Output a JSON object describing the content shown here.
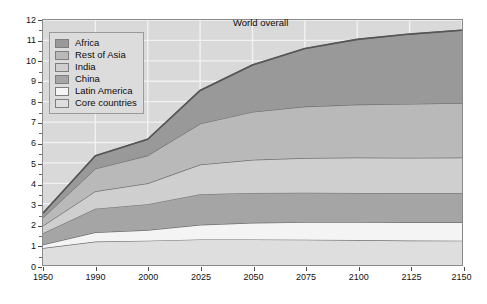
{
  "figure": {
    "background": "#ffffff",
    "plot_background": "#d9d9d9",
    "gridline_color": "#f2f2f2",
    "frame_color": "#8a8a8a"
  },
  "annotation": {
    "world_overall": "World overall"
  },
  "legend": {
    "position": "top-left",
    "entries": [
      {
        "label": "Africa",
        "color": "#999999"
      },
      {
        "label": "Rest of Asia",
        "color": "#b9b9b9"
      },
      {
        "label": "India",
        "color": "#cfcfcf"
      },
      {
        "label": "China",
        "color": "#a5a5a5"
      },
      {
        "label": "Latin America",
        "color": "#f4f4f4"
      },
      {
        "label": "Core countries",
        "color": "#dedede"
      }
    ]
  },
  "chart_data": {
    "type": "area",
    "stacked": true,
    "title": "",
    "subtitle": "",
    "xlabel": "",
    "ylabel": "",
    "ylim": [
      0,
      12
    ],
    "yticks": [
      0,
      1,
      2,
      3,
      4,
      5,
      6,
      7,
      8,
      9,
      10,
      11,
      12
    ],
    "ytick_labels": [
      "0",
      "1",
      "2",
      "3",
      "4",
      "5",
      "6",
      "7",
      "8",
      "9",
      "10",
      "11",
      "12"
    ],
    "grid": true,
    "x_axis_scale": "categorical-uneven-years",
    "x": [
      1950,
      1990,
      2000,
      2025,
      2050,
      2075,
      2100,
      2125,
      2150
    ],
    "xtick_labels": [
      "1950",
      "1990",
      "2000",
      "2025",
      "2050",
      "2075",
      "2100",
      "2125",
      "2150"
    ],
    "stack_order_bottom_to_top": [
      "Core countries",
      "Latin America",
      "China",
      "India",
      "Rest of Asia",
      "Africa"
    ],
    "series": [
      {
        "name": "Core countries",
        "color": "#dedede",
        "values": [
          0.83,
          1.15,
          1.19,
          1.25,
          1.25,
          1.24,
          1.22,
          1.2,
          1.19
        ]
      },
      {
        "name": "Latin America",
        "color": "#f4f4f4",
        "values": [
          0.17,
          0.45,
          0.52,
          0.72,
          0.82,
          0.86,
          0.88,
          0.89,
          0.9
        ]
      },
      {
        "name": "China",
        "color": "#a5a5a5",
        "values": [
          0.56,
          1.16,
          1.27,
          1.5,
          1.46,
          1.44,
          1.43,
          1.42,
          1.42
        ]
      },
      {
        "name": "India",
        "color": "#cfcfcf",
        "values": [
          0.36,
          0.85,
          1.02,
          1.45,
          1.62,
          1.7,
          1.73,
          1.74,
          1.75
        ]
      },
      {
        "name": "Rest of Asia",
        "color": "#b9b9b9",
        "values": [
          0.4,
          1.11,
          1.36,
          2.0,
          2.35,
          2.52,
          2.6,
          2.64,
          2.67
        ]
      },
      {
        "name": "Africa",
        "color": "#999999",
        "values": [
          0.22,
          0.63,
          0.8,
          1.63,
          2.3,
          2.84,
          3.19,
          3.42,
          3.57
        ]
      }
    ],
    "cumulative_top_of_each_band": {
      "Core countries": [
        0.83,
        1.15,
        1.19,
        1.25,
        1.25,
        1.24,
        1.22,
        1.2,
        1.19
      ],
      "Latin America": [
        1.0,
        1.6,
        1.71,
        1.97,
        2.07,
        2.1,
        2.1,
        2.09,
        2.09
      ],
      "China": [
        1.56,
        2.76,
        2.98,
        3.47,
        3.53,
        3.54,
        3.53,
        3.51,
        3.51
      ],
      "India": [
        1.92,
        3.61,
        4.0,
        4.92,
        5.15,
        5.24,
        5.26,
        5.25,
        5.26
      ],
      "Rest of Asia": [
        2.32,
        4.72,
        5.36,
        6.92,
        7.5,
        7.76,
        7.86,
        7.89,
        7.93
      ],
      "Africa": [
        2.54,
        5.35,
        6.16,
        8.55,
        9.8,
        10.6,
        11.05,
        11.31,
        11.5
      ]
    },
    "world_total": [
      2.54,
      5.35,
      6.16,
      8.55,
      9.8,
      10.6,
      11.05,
      11.31,
      11.5
    ],
    "units": "billions of people"
  }
}
